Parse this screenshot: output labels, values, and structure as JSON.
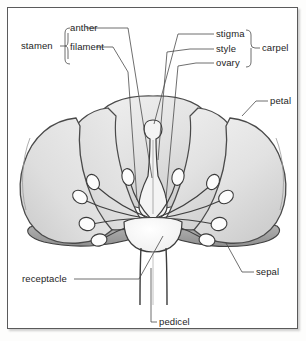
{
  "diagram": {
    "style": "pencil line drawing, grayscale shading"
  },
  "labels": {
    "stamen": "stamen",
    "anther": "anther",
    "filament": "filament",
    "stigma": "stigma",
    "style": "style",
    "ovary": "ovary",
    "carpel": "carpel",
    "petal": "petal",
    "sepal": "sepal",
    "receptacle": "receptacle",
    "pedicel": "pedicel"
  },
  "colors": {
    "ink": "#3a3a3a",
    "leader": "#4a4a4a",
    "petal_fill": "#e3e3e3",
    "petal_fill_dark": "#d2d2d2",
    "sepal_fill": "#a8a8a8",
    "receptacle_fill": "#fbfbfb",
    "anther_fill": "#fcfcfc",
    "border": "#5a5a5a",
    "text": "#1d1d1d"
  },
  "parts": {
    "stamen_count": 10,
    "petal_count": 5,
    "sepal_count": 2,
    "carpel_count": 1
  }
}
